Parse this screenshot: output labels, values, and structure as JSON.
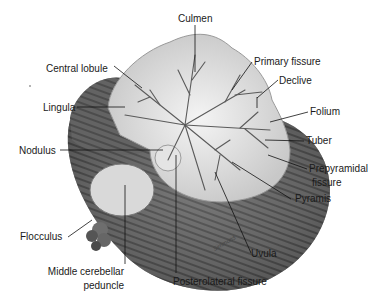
{
  "diagram": {
    "labels": {
      "culmen": "Culmen",
      "central_lobule": "Central lobule",
      "primary_fissure": "Primary fissure",
      "declive": "Declive",
      "lingula": "Lingula",
      "folium": "Folium",
      "nodulus": "Nodulus",
      "tuber": "Tuber",
      "prepyramidal_fissure_1": "Prepyramidal",
      "prepyramidal_fissure_2": "fissure",
      "pyramis": "Pyramis",
      "flocculus": "Flocculus",
      "middle_cerebellar_peduncle_1": "Middle cerebellar",
      "middle_cerebellar_peduncle_2": "peduncle",
      "uvula": "Uvula",
      "posterolateral_fissure": "Posterolateral fissure"
    },
    "signature": "Simmons",
    "colors": {
      "background": "#ffffff",
      "tissue_light": "#e6e6e6",
      "tissue_mid": "#9a9a9a",
      "tissue_dark": "#3a3a3a",
      "leader_line": "#111111"
    }
  }
}
